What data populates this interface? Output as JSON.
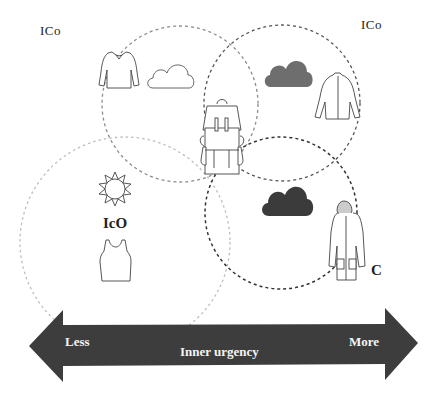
{
  "labels": {
    "top_left": "ICo",
    "top_right": "ICo",
    "center_left": "IcO",
    "bottom_right": "C"
  },
  "arrow": {
    "left_label": "Less",
    "center_label": "Inner urgency",
    "right_label": "More",
    "color": "#3d3d3d"
  },
  "icons": {
    "sweater": "long-sleeve-shirt-outline",
    "cloud_light": "cloud-outline",
    "cloud_grey": "cloud-filled-grey",
    "jacket": "jacket-outline",
    "backpack": "backpack-outline",
    "sun": "sun-outline",
    "tank_top": "tank-top-outline",
    "cloud_dark": "cloud-filled-dark",
    "raincoat": "hooded-raincoat-outline"
  },
  "colors": {
    "circle_light": "#b8b8b8",
    "circle_mid": "#8a8a8a",
    "circle_dark": "#333333",
    "cloud_grey": "#6e6e6e",
    "cloud_dark": "#3b3b3b"
  }
}
